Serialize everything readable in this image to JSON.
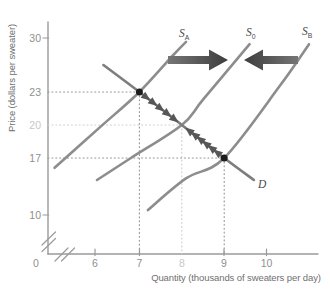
{
  "chart_data": {
    "type": "line",
    "title": "",
    "xlabel": "Quantity (thousands of sweaters per day)",
    "ylabel": "Price (dollars per sweater)",
    "xlim": [
      0,
      11
    ],
    "ylim": [
      0,
      32
    ],
    "grid": false,
    "axis_breaks": {
      "x": true,
      "y": true
    },
    "x_ticks": [
      {
        "label": "0",
        "value": 0,
        "muted": false
      },
      {
        "label": "6",
        "value": 6,
        "muted": false
      },
      {
        "label": "7",
        "value": 7,
        "muted": false
      },
      {
        "label": "8",
        "value": 8,
        "muted": true
      },
      {
        "label": "9",
        "value": 9,
        "muted": false
      },
      {
        "label": "10",
        "value": 10,
        "muted": false
      }
    ],
    "y_ticks": [
      {
        "label": "30",
        "value": 30,
        "muted": false
      },
      {
        "label": "23",
        "value": 23,
        "muted": false
      },
      {
        "label": "20",
        "value": 20,
        "muted": true
      },
      {
        "label": "17",
        "value": 17,
        "muted": false
      },
      {
        "label": "10",
        "value": 10,
        "muted": false
      }
    ],
    "series": [
      {
        "id": "SA",
        "label": "S",
        "sub": "A",
        "role": "supply",
        "points": [
          [
            5.0,
            15.8
          ],
          [
            6.1,
            19.9
          ],
          [
            7,
            23
          ],
          [
            7.8,
            27.8
          ],
          [
            8.1,
            29.5
          ]
        ]
      },
      {
        "id": "S0",
        "label": "S",
        "sub": "0",
        "role": "supply",
        "points": [
          [
            6.0,
            14.3
          ],
          [
            6.8,
            17.0
          ],
          [
            8,
            20
          ],
          [
            8.5,
            22.3
          ],
          [
            9.6,
            29.2
          ]
        ]
      },
      {
        "id": "SB",
        "label": "S",
        "sub": "B",
        "role": "supply",
        "points": [
          [
            7.2,
            10.6
          ],
          [
            8.1,
            14.5
          ],
          [
            9,
            17
          ],
          [
            10.3,
            23.7
          ],
          [
            11.0,
            29.2
          ]
        ]
      },
      {
        "id": "D",
        "label": "D",
        "sub": "",
        "role": "demand",
        "points": [
          [
            6.15,
            26.5
          ],
          [
            7,
            23
          ],
          [
            8,
            20
          ],
          [
            9,
            17
          ],
          [
            9.7,
            14.3
          ]
        ]
      }
    ],
    "equilibria": [
      {
        "q": 7,
        "p": 23,
        "dot": true,
        "guide": "dark"
      },
      {
        "q": 8,
        "p": 20,
        "dot": false,
        "guide": "light"
      },
      {
        "q": 9,
        "p": 17,
        "dot": true,
        "guide": "dark"
      }
    ],
    "movement_chevrons": [
      {
        "from": [
          7,
          23
        ],
        "to": [
          8,
          20
        ],
        "count": 5
      },
      {
        "from": [
          9,
          17
        ],
        "to": [
          8,
          20
        ],
        "count": 6
      }
    ],
    "shift_arrows": [
      {
        "direction": "right",
        "meaning": "shift from S_A toward S_0"
      },
      {
        "direction": "left",
        "meaning": "shift from S_B toward S_0"
      }
    ],
    "colors": {
      "supply": "#8d8d8d",
      "demand": "#7d7d7d",
      "dot": "#1b1b1b",
      "chevron": "#575757",
      "arrow_head": "#3e3e3e",
      "arrow_tail": "#757575",
      "guide_dark": "#969696",
      "guide_light": "#cecece",
      "axis": "#9a9a9a",
      "tick_label": "#8f8f8f",
      "tick_label_muted": "#c7c7c7",
      "axis_title": "#6f6f6f",
      "curve_label": "#4a4a4a"
    }
  }
}
